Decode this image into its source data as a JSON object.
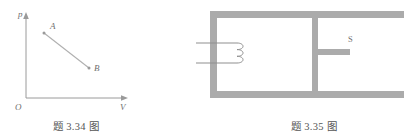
{
  "page": {
    "background": "#ffffff",
    "width": 404,
    "height": 139
  },
  "figures": [
    {
      "id": "pv-diagram",
      "caption": "题 3.34 图",
      "type": "pv-plot",
      "colors": {
        "axis": "#9a9a9a",
        "line": "#b0b0b0",
        "text": "#6f6f6f"
      },
      "axes": {
        "y_label": "p",
        "x_label": "V",
        "origin_label": "O"
      },
      "points": [
        {
          "label": "A",
          "x": 0.3,
          "y": 0.78
        },
        {
          "label": "B",
          "x": 0.72,
          "y": 0.33
        }
      ],
      "process": {
        "from": "A",
        "to": "B",
        "description": "straight line segment from A down to B"
      }
    },
    {
      "id": "magnetic-core-diagram",
      "caption": "题 3.35 图",
      "type": "magnetic-circuit",
      "colors": {
        "core": "#ababab",
        "wire": "#8f8f8f",
        "text": "#6f6f6f"
      },
      "labels": {
        "gap": "S"
      },
      "parts": {
        "coil_turns": 3,
        "lead_count": 2,
        "center_limb": true,
        "gap_stub": true
      }
    }
  ]
}
